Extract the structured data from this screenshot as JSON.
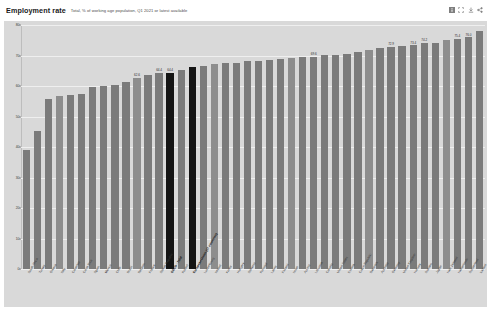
{
  "header": {
    "title": "Employment rate",
    "subtitle": "Total, % of working age population, Q1 2021 or latest available",
    "icons": [
      {
        "name": "info-icon",
        "glyph": "info"
      },
      {
        "name": "fullscreen-icon",
        "glyph": "fullscreen"
      },
      {
        "name": "download-icon",
        "glyph": "download"
      },
      {
        "name": "share-icon",
        "glyph": "share"
      }
    ]
  },
  "colors": {
    "plot_background": "#d9d9d9",
    "bar": "#7b7b7b",
    "bar_highlight": "#141414",
    "gridline": "#efefef",
    "page_background": "#ffffff"
  },
  "chart_data": {
    "type": "bar",
    "title": "Employment rate",
    "subtitle": "Total, % of working age population, Q1 2021 or latest available",
    "xlabel": "",
    "ylabel": "",
    "ylim": [
      0,
      80
    ],
    "yticks": [
      0,
      10,
      20,
      30,
      40,
      50,
      60,
      70,
      80
    ],
    "ytick_labels": [
      "0",
      "10",
      "20",
      "30",
      "40",
      "50",
      "60",
      "70",
      "80"
    ],
    "grid": true,
    "legend": "none",
    "categories": [
      "South Africa",
      "Turkey",
      "Greece",
      "Italy",
      "Colombia",
      "Costa Rica",
      "Spain",
      "Mexico",
      "Chile",
      "Brazil",
      "Belgium",
      "France",
      "Slovak Republic",
      "OECD - Total",
      "Poland",
      "European Union (27 countries)",
      "Luxembourg",
      "Ireland",
      "Korea",
      "Hungary",
      "Slovenia",
      "Portugal",
      "Latvia",
      "Finland",
      "Israel",
      "Austria",
      "Lithuania",
      "Canada",
      "United States",
      "Estonia",
      "Czech Republic",
      "Denmark",
      "Australia",
      "Germany",
      "United Kingdom",
      "Norway",
      "Sweden",
      "Japan",
      "New Zealand",
      "Netherlands",
      "Switzerland",
      "Iceland"
    ],
    "values": [
      39.0,
      45.2,
      55.8,
      56.6,
      57.2,
      57.4,
      59.7,
      59.9,
      60.2,
      61.4,
      62.6,
      63.5,
      64.4,
      64.4,
      65.4,
      66.1,
      66.6,
      67.2,
      67.4,
      67.5,
      68.1,
      68.3,
      68.5,
      68.9,
      69.3,
      69.4,
      69.6,
      70.1,
      70.3,
      70.6,
      71.2,
      71.7,
      72.4,
      72.9,
      73.1,
      73.4,
      74.2,
      74.1,
      75.1,
      75.4,
      76.0,
      78.2
    ],
    "labeled_points": {
      "Belgium": "62.6",
      "Slovak Republic": "64.4",
      "OECD - Total": "64.4",
      "Lithuania": "69.6",
      "Germany": "72.9",
      "Norway": "73.4",
      "Sweden": "74.2",
      "Netherlands": "75.4",
      "Switzerland": "76.0"
    },
    "highlighted": [
      "OECD - Total",
      "European Union (27 countries)"
    ],
    "sort": "ascending"
  }
}
